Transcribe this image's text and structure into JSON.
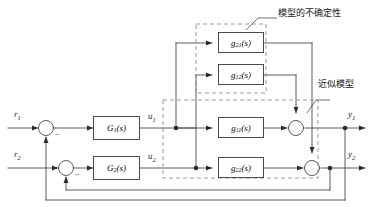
{
  "diagram": {
    "annotations": {
      "uncertainty": "模型的不确定性",
      "approximate_model": "近似模型"
    },
    "inputs": [
      {
        "id": "r1",
        "label": "r",
        "sub": "1"
      },
      {
        "id": "r2",
        "label": "r",
        "sub": "2"
      }
    ],
    "outputs": [
      {
        "id": "y1",
        "label": "y",
        "sub": "1"
      },
      {
        "id": "y2",
        "label": "y",
        "sub": "2"
      }
    ],
    "internal_signals": [
      {
        "id": "u1",
        "label": "u",
        "sub": "1"
      },
      {
        "id": "u2",
        "label": "u",
        "sub": "2"
      }
    ],
    "blocks": [
      {
        "id": "G1",
        "base": "G",
        "sub": "1",
        "arg": "(s)",
        "group": "controller"
      },
      {
        "id": "G2",
        "base": "G",
        "sub": "2",
        "arg": "(s)",
        "group": "controller"
      },
      {
        "id": "g21",
        "base": "g",
        "sub": "21",
        "arg": "(s)",
        "group": "uncertainty"
      },
      {
        "id": "g12",
        "base": "g",
        "sub": "12",
        "arg": "(s)",
        "group": "uncertainty"
      },
      {
        "id": "g11",
        "base": "g",
        "sub": "11",
        "arg": "(s)",
        "group": "approximate-model"
      },
      {
        "id": "g22",
        "base": "g",
        "sub": "22",
        "arg": "(s)",
        "group": "approximate-model"
      }
    ],
    "summing_junctions": [
      {
        "id": "sum-r1",
        "sign": "−"
      },
      {
        "id": "sum-r2",
        "sign": "−"
      },
      {
        "id": "sum-y1",
        "sign": ""
      },
      {
        "id": "sum-y2",
        "sign": ""
      }
    ],
    "colors": {
      "line": "#4a4a4a",
      "dashed": "#8c8c8c",
      "text": "#1a1a1a",
      "background": "#ffffff"
    }
  }
}
